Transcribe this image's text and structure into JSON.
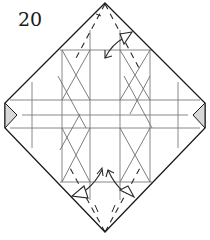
{
  "step": {
    "number": "20"
  },
  "diagram": {
    "type": "origami-crease-pattern-step",
    "colors": {
      "outline": "#1a1a1a",
      "crease": "#6e6e6e",
      "valley_fold": "#2a2a2a",
      "flap_fill": "#d8d8d8",
      "arrow": "#2a2a2a"
    },
    "elements": [
      "diamond-outline",
      "grid-creases",
      "diagonal-creases",
      "valley-fold-lines-top-and-bottom",
      "fold-arrows-top",
      "fold-arrows-bottom",
      "side-flaps-left-and-right"
    ]
  }
}
